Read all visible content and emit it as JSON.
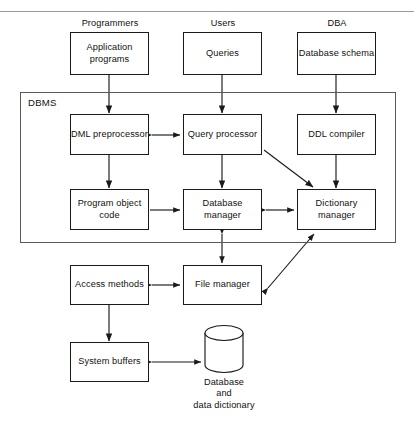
{
  "figure": {
    "type": "block-diagram",
    "stroke_color": "#1a1a1a",
    "group_stroke_color": "#5a5a5a",
    "background": "#ffffff"
  },
  "actors": {
    "programmers": "Programmers",
    "users": "Users",
    "dba": "DBA"
  },
  "group": {
    "dbms_label": "DBMS"
  },
  "nodes": {
    "application_programs": "Application\nprograms",
    "queries": "Queries",
    "database_schema": "Database\nschema",
    "dml_preprocessor": "DML\npreprocessor",
    "query_processor": "Query\nprocessor",
    "ddl_compiler": "DDL\ncompiler",
    "program_object_code": "Program\nobject code",
    "database_manager": "Database\nmanager",
    "dictionary_manager": "Dictionary\nmanager",
    "access_methods": "Access\nmethods",
    "file_manager": "File\nmanager",
    "system_buffers": "System\nbuffers",
    "database_store": "Database\nand\ndata dictionary"
  },
  "edges": [
    {
      "from": "application_programs",
      "to": "dml_preprocessor",
      "arrow": "single"
    },
    {
      "from": "queries",
      "to": "query_processor",
      "arrow": "single"
    },
    {
      "from": "database_schema",
      "to": "ddl_compiler",
      "arrow": "single"
    },
    {
      "from": "dml_preprocessor",
      "to": "query_processor",
      "arrow": "double"
    },
    {
      "from": "dml_preprocessor",
      "to": "program_object_code",
      "arrow": "single"
    },
    {
      "from": "query_processor",
      "to": "database_manager",
      "arrow": "single"
    },
    {
      "from": "query_processor",
      "to": "dictionary_manager",
      "arrow": "single"
    },
    {
      "from": "ddl_compiler",
      "to": "dictionary_manager",
      "arrow": "single"
    },
    {
      "from": "program_object_code",
      "to": "database_manager",
      "arrow": "single"
    },
    {
      "from": "database_manager",
      "to": "dictionary_manager",
      "arrow": "double"
    },
    {
      "from": "database_manager",
      "to": "file_manager",
      "arrow": "double"
    },
    {
      "from": "access_methods",
      "to": "file_manager",
      "arrow": "double"
    },
    {
      "from": "file_manager",
      "to": "dictionary_manager",
      "arrow": "double"
    },
    {
      "from": "access_methods",
      "to": "system_buffers",
      "arrow": "single"
    },
    {
      "from": "system_buffers",
      "to": "database_store",
      "arrow": "double"
    }
  ]
}
